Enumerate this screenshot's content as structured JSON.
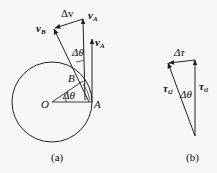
{
  "figure_a": {
    "caption": "(a)",
    "labels": {
      "vB": "v",
      "vB_sub": "B",
      "delta_v": "Δv",
      "vA_top": "v",
      "vA_top_sub": "A",
      "vA_small": "v",
      "vA_small_sub": "A",
      "delta_theta_top": "Δθ",
      "delta_theta_center": "Δθ",
      "point_B": "B",
      "point_O": "O",
      "point_A": "A"
    }
  },
  "figure_b": {
    "caption": "(b)",
    "labels": {
      "delta_tau": "Δτ",
      "tau_t2": "τ",
      "tau_t2_sub": "t2",
      "tau_t1": "τ",
      "tau_t1_sub": "t1",
      "delta_theta": "Δθ"
    }
  },
  "colors": {
    "line": "#222222",
    "background": "#f7f7f5"
  }
}
